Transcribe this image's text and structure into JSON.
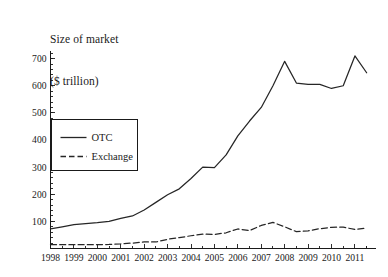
{
  "chart_data": {
    "type": "line",
    "title": "Size of market\n($ trillion)",
    "title_line1": "Size of market",
    "title_line2": "($ trillion)",
    "xlabel": "",
    "ylabel": "Size of market ($ trillion)",
    "ylim": [
      0,
      730
    ],
    "xlim": [
      1998,
      2011.9
    ],
    "grid": false,
    "legend_position": "upper-left-inside",
    "y_ticks": [
      0,
      100,
      200,
      300,
      400,
      500,
      600,
      700
    ],
    "y_tick_labels": [
      "",
      "100",
      "200",
      "300",
      "400",
      "500",
      "600",
      "700"
    ],
    "y_minor_tick_step": 20,
    "x_ticks": [
      1998,
      1999,
      2000,
      2001,
      2002,
      2003,
      2004,
      2005,
      2006,
      2007,
      2008,
      2009,
      2010,
      2011
    ],
    "x_tick_labels": [
      "1998",
      "1999",
      "2000",
      "2001",
      "2002",
      "2003",
      "2004",
      "2005",
      "2006",
      "2007",
      "2008",
      "2009",
      "2010",
      "2011"
    ],
    "x_minor_ticks_per_year": 2,
    "x": [
      1998,
      1998.5,
      1999,
      1999.5,
      2000,
      2000.5,
      2001,
      2001.5,
      2002,
      2002.5,
      2003,
      2003.5,
      2004,
      2004.5,
      2005,
      2005.5,
      2006,
      2006.5,
      2007,
      2007.5,
      2008,
      2008.5,
      2009,
      2009.5,
      2010,
      2010.5,
      2011,
      2011.5
    ],
    "series": [
      {
        "name": "OTC",
        "style": "solid",
        "color": "#262626",
        "values": [
          72,
          80,
          88,
          92,
          95,
          100,
          111,
          120,
          142,
          170,
          198,
          220,
          258,
          300,
          298,
          345,
          415,
          470,
          520,
          600,
          690,
          610,
          605,
          605,
          590,
          600,
          710,
          648
        ]
      },
      {
        "name": "Exchange",
        "style": "dashed",
        "color": "#262626",
        "values": [
          14,
          14,
          14,
          14,
          14,
          15,
          17,
          20,
          24,
          24,
          34,
          40,
          47,
          53,
          52,
          58,
          72,
          66,
          85,
          96,
          80,
          62,
          65,
          73,
          78,
          79,
          70,
          76
        ]
      }
    ],
    "legend": [
      {
        "label": "OTC",
        "style": "solid"
      },
      {
        "label": "Exchange",
        "style": "dashed"
      }
    ]
  }
}
